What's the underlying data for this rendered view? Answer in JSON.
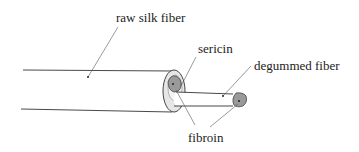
{
  "diagram": {
    "title": "",
    "labels": {
      "raw_fiber": "raw silk fiber",
      "sericin": "sericin",
      "degummed_fiber": "degummed fiber",
      "fibroin": "fibroin"
    },
    "components": [
      {
        "id": "raw_fiber",
        "name": "raw silk fiber",
        "description": "outer cylinder coated with sericin"
      },
      {
        "id": "sericin",
        "name": "sericin",
        "description": "light-gray outer coating layer"
      },
      {
        "id": "fibroin",
        "name": "fibroin",
        "description": "dark-gray inner core"
      },
      {
        "id": "degummed_fiber",
        "name": "degummed fiber",
        "description": "inner thinner cylinder after sericin removal"
      }
    ],
    "colors": {
      "outline": "#333333",
      "sericin_fill": "#e0e0e0",
      "fibroin_fill": "#9a9a9a",
      "background": "#ffffff"
    }
  }
}
